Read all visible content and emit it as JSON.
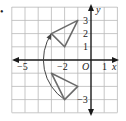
{
  "figure": {
    "bullet": "•",
    "grid": {
      "xmin": -6,
      "xmax": 2,
      "ymin": -4,
      "ymax": 4,
      "color": "#b9b9b9"
    },
    "axes": {
      "x_label": "x",
      "y_label": "y",
      "origin_label": "O",
      "x_ticks": [
        {
          "value": -5,
          "label": "−5"
        },
        {
          "value": -2,
          "label": "−2"
        },
        {
          "value": 1,
          "label": "1"
        }
      ],
      "y_ticks": [
        {
          "value": 3,
          "label": "3"
        },
        {
          "value": 2,
          "label": "2"
        },
        {
          "value": 1,
          "label": "1"
        },
        {
          "value": -3,
          "label": "−3"
        }
      ],
      "color": "#1a1a1a"
    },
    "shapes": {
      "preimage_triangle": {
        "vertices": [
          [
            -3,
            -1
          ],
          [
            -1,
            -2
          ],
          [
            -2,
            -3
          ]
        ],
        "color": "#6b6b6b"
      },
      "image_triangle": {
        "vertices": [
          [
            -3,
            2
          ],
          [
            -1,
            3
          ],
          [
            -2,
            1
          ]
        ],
        "color": "#6b6b6b"
      },
      "rotation_arc": {
        "from": [
          -2,
          -3
        ],
        "to": [
          -3,
          2
        ],
        "center": [
          0,
          0
        ],
        "direction": "clockwise",
        "color": "#444444"
      }
    }
  }
}
